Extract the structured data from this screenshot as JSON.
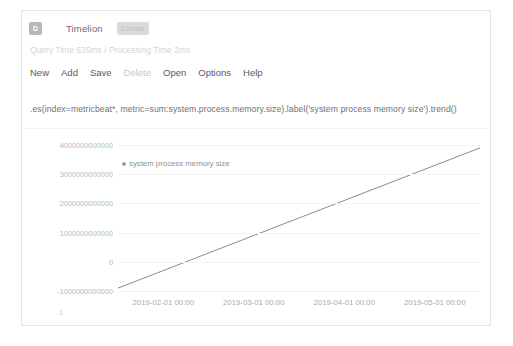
{
  "header": {
    "logo_letter": "D",
    "title": "Timelion",
    "mode_badge": "Create"
  },
  "status": {
    "query_stats": "Query Time 635ms / Processing Time 2ms"
  },
  "menu": {
    "items": [
      {
        "label": "New",
        "disabled": false
      },
      {
        "label": "Add",
        "disabled": false
      },
      {
        "label": "Save",
        "disabled": false
      },
      {
        "label": "Delete",
        "disabled": true
      },
      {
        "label": "Open",
        "disabled": false
      },
      {
        "label": "Options",
        "disabled": false
      },
      {
        "label": "Help",
        "disabled": false
      }
    ]
  },
  "expression": {
    "value": ".es(index=metricbeat*, metric=sum:system.process.memory.size).label('system process memory size').trend()",
    "placeholder": ".es(*)"
  },
  "chart_data": {
    "type": "line",
    "title": "",
    "xlabel": "",
    "ylabel": "",
    "grid": true,
    "legend_position": "inside-top-left",
    "line_color": "#8a8c8f",
    "ylim": [
      -1000000000000,
      4000000000000
    ],
    "y_ticks": [
      4000000000000,
      3000000000000,
      2000000000000,
      1000000000000,
      0,
      -1000000000000
    ],
    "y_tick_labels": [
      "4000000000000",
      "3000000000000",
      "2000000000000",
      "1000000000000",
      "0",
      "-1000000000000"
    ],
    "x_tick_labels": [
      "2019-02-01 00:00",
      "2019-03-01 00:00",
      "2019-04-01 00:00",
      "2019-05-01 00:00"
    ],
    "axis_corner_label": "1",
    "series": [
      {
        "name": "system process memory size",
        "x": [
          "2019-01-18 00:00",
          "2019-05-05 00:00"
        ],
        "values": [
          -900000000000,
          3900000000000
        ]
      }
    ]
  }
}
